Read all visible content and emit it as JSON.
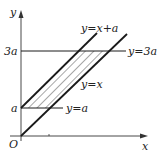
{
  "diagram": {
    "axes": {
      "x_label": "x",
      "y_label": "y",
      "origin_label": "O"
    },
    "y_ticks": [
      {
        "label": "a"
      },
      {
        "label": "3a"
      }
    ],
    "lines": [
      {
        "id": "line-y-eq-x-plus-a",
        "label": "y=x+a"
      },
      {
        "id": "line-y-eq-x",
        "label": "y=x"
      },
      {
        "id": "line-y-eq-3a",
        "label": "y=3a"
      },
      {
        "id": "line-y-eq-a",
        "label": "y=a"
      }
    ],
    "shaded_region": "region between y=x and y=x+a, bounded by y=a and y=3a (hatched)",
    "colors": {
      "stroke": "#1a1a1a",
      "axis": "#333333",
      "background": "#ffffff"
    }
  }
}
